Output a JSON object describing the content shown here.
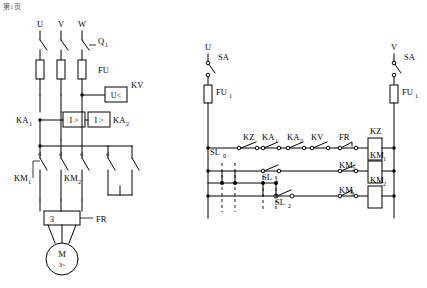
{
  "corner_mark": "第1页",
  "left_circuit": {
    "name": "主电路",
    "phase_labels": [
      "U",
      "V",
      "W"
    ],
    "breaker_label": "Q",
    "breaker_sub": "1",
    "fuse_label": "FU",
    "voltage_relay_label": "KV",
    "voltage_relay_symbol": "U<",
    "current_relay_1_label": "KA",
    "current_relay_1_sub": "1",
    "current_relay_1_symbol": "I >",
    "current_relay_2_label": "KA",
    "current_relay_2_sub": "2",
    "current_relay_2_symbol": "I >",
    "contactor_1_label": "KM",
    "contactor_1_sub": "1",
    "contactor_2_label": "KM",
    "contactor_2_sub": "2",
    "resistor_box_label": "3",
    "thermal_relay_label": "FR",
    "motor_label": "M",
    "motor_sub": "3~",
    "contact_marks": [
      "d",
      "d",
      "d",
      "d"
    ]
  },
  "right_circuit": {
    "name": "控制电路",
    "left_phase_label": "U",
    "right_phase_label": "V",
    "switch_left_label": "SA",
    "switch_right_label": "SA",
    "fuse_left_label": "FU",
    "fuse_left_sub": "1",
    "fuse_right_label": "FU",
    "fuse_right_sub": "1",
    "row_labels": {
      "kz_contact": "KZ",
      "ka1_contact": "KA",
      "ka1_sub": "1",
      "ka2_contact": "KA",
      "ka2_sub": "2",
      "kv_contact": "KV",
      "fr_contact": "FR",
      "kz_coil": "KZ",
      "km1_coil": "KM",
      "km1_sub": "1",
      "km2_contact": "KM",
      "km2_sub": "2",
      "km2_coil": "KM",
      "km2_coil_sub": "2",
      "km1_contact": "KM",
      "km1_contact_sub": "1",
      "sl0": "SL",
      "sl0_sub": "0",
      "sl1": "SL",
      "sl1_sub": "1",
      "sl2": "SL",
      "sl2_sub": "2"
    }
  }
}
